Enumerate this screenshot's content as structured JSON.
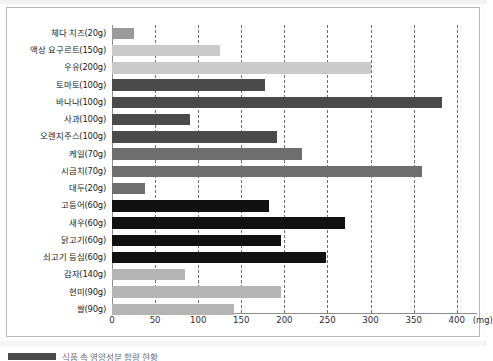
{
  "chart_data": {
    "type": "bar",
    "orientation": "horizontal",
    "title": "",
    "xlabel": "(mg)",
    "ylabel": "",
    "xlim": [
      0,
      420
    ],
    "grid": true,
    "legend_position": "bottom-left",
    "unit_label": "(mg)",
    "x_ticks": [
      0,
      50,
      100,
      150,
      200,
      250,
      300,
      350,
      400
    ],
    "x_tick_labels": [
      "0",
      "50",
      "100",
      "150",
      "200",
      "250",
      "300",
      "350",
      "400"
    ],
    "categories": [
      "체다 치즈(20g)",
      "액상 요구르트(150g)",
      "우유(200g)",
      "토마토(100g)",
      "바나나(100g)",
      "사과(100g)",
      "오렌지주스(100g)",
      "케일(70g)",
      "시금치(70g)",
      "대두(20g)",
      "고등어(60g)",
      "새우(60g)",
      "닭고기(60g)",
      "쇠고기 등심(60g)",
      "감자(140g)",
      "현미(90g)",
      "쌀(90g)"
    ],
    "values": [
      25,
      125,
      300,
      178,
      383,
      90,
      192,
      220,
      360,
      38,
      182,
      270,
      196,
      248,
      85,
      196,
      142
    ],
    "bar_colors": [
      "#9a9a9a",
      "#c9c9c9",
      "#c9c9c9",
      "#4a4a4a",
      "#4a4a4a",
      "#4a4a4a",
      "#4a4a4a",
      "#6e6e6e",
      "#6e6e6e",
      "#6e6e6e",
      "#111111",
      "#111111",
      "#111111",
      "#111111",
      "#b4b4b4",
      "#b4b4b4",
      "#b4b4b4"
    ]
  },
  "caption": {
    "swatch_color": "#4a4a4a",
    "text": "식품 속 영양성분 함량 현황"
  },
  "colors": {
    "frame_border": "#b9b9b9",
    "gridline": "#6f6f6f",
    "axis": "#8e8e8e",
    "label_text": "#1a1a1a",
    "tick_text": "#2b2b2b"
  }
}
